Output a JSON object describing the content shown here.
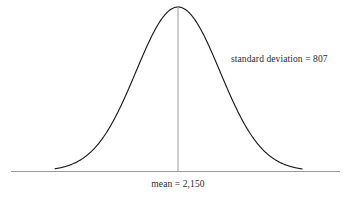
{
  "figure": {
    "type": "normal-distribution-curve",
    "background_color": "#ffffff",
    "curve_color": "#1c1c1c",
    "axis_color": "#9a9a9a",
    "mean_line_color": "#a3a3a3",
    "text_color": "#2b2b2b"
  },
  "labels": {
    "standard_deviation": "standard deviation = 807",
    "mean": "mean = 2,150"
  },
  "chart_data": {
    "type": "line",
    "title": "",
    "subtitle": "",
    "xlabel": "",
    "ylabel": "",
    "grid": false,
    "legend": null,
    "distribution": "normal",
    "mean": 2150,
    "standard_deviation": 807,
    "annotations": [
      {
        "name": "mean-annotation",
        "text": "mean = 2,150",
        "value": 2150,
        "position": "below-axis-at-mean"
      },
      {
        "name": "standard-deviation-annotation",
        "text": "standard deviation = 807",
        "value": 807,
        "position": "upper-right"
      }
    ],
    "axis": {
      "x_pixel_start": 11,
      "x_pixel_end": 340,
      "baseline_y": 171,
      "x_range_sigma": [
        -3.1,
        3.1
      ],
      "x_value_range": [
        -348,
        4648
      ]
    },
    "curve": {
      "peak_x_pixel": 178,
      "peak_y_pixel": 7,
      "sigma_pixels": 42,
      "tail_left_pixel": 56,
      "tail_right_pixel": 301
    },
    "x": [
      -3.1,
      -2.9,
      -2.7,
      -2.5,
      -2.3,
      -2.1,
      -1.9,
      -1.7,
      -1.5,
      -1.3,
      -1.1,
      -0.9,
      -0.7,
      -0.5,
      -0.3,
      -0.1,
      0.1,
      0.3,
      0.5,
      0.7,
      0.9,
      1.1,
      1.3,
      1.5,
      1.7,
      1.9,
      2.1,
      2.3,
      2.5,
      2.7,
      2.9,
      3.1
    ],
    "values": [
      0.0082,
      0.0175,
      0.0264,
      0.0439,
      0.0714,
      0.1109,
      0.1647,
      0.2371,
      0.3247,
      0.4296,
      0.5461,
      0.667,
      0.7827,
      0.8825,
      0.956,
      0.995,
      0.995,
      0.956,
      0.8825,
      0.7827,
      0.667,
      0.5461,
      0.4296,
      0.3247,
      0.2371,
      0.1647,
      0.1109,
      0.0714,
      0.0439,
      0.0264,
      0.0175,
      0.0082
    ],
    "ylim": [
      0,
      1
    ]
  }
}
